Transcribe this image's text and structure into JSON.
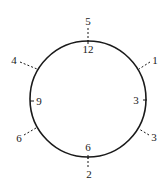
{
  "diagram": {
    "type": "clock-face-diagram",
    "circle": {
      "cx": 88,
      "cy": 99,
      "r": 58,
      "stroke": "#1a1a1a"
    },
    "inner_labels": [
      {
        "text": "12",
        "position": "top",
        "x": 88,
        "y": 49
      },
      {
        "text": "3",
        "position": "right",
        "x": 136,
        "y": 100
      },
      {
        "text": "6",
        "position": "bottom",
        "x": 88,
        "y": 147
      },
      {
        "text": "9",
        "position": "left",
        "x": 39,
        "y": 101
      }
    ],
    "outer_labels": [
      {
        "text": "5",
        "position": "top",
        "x": 88,
        "y": 21
      },
      {
        "text": "1",
        "position": "upper-right",
        "x": 155,
        "y": 60
      },
      {
        "text": "3",
        "position": "lower-right",
        "x": 154,
        "y": 137
      },
      {
        "text": "2",
        "position": "bottom",
        "x": 89,
        "y": 174
      },
      {
        "text": "6",
        "position": "lower-left",
        "x": 19,
        "y": 138
      },
      {
        "text": "4",
        "position": "upper-left",
        "x": 14,
        "y": 60
      }
    ],
    "leader_lines": [
      {
        "from": "top",
        "x1": 88,
        "y1": 28,
        "x2": 88,
        "y2": 44
      },
      {
        "from": "upper-right",
        "x1": 150,
        "y1": 62,
        "x2": 139,
        "y2": 69
      },
      {
        "from": "lower-right",
        "x1": 149,
        "y1": 135,
        "x2": 139,
        "y2": 129
      },
      {
        "from": "bottom",
        "x1": 88,
        "y1": 157,
        "x2": 88,
        "y2": 168
      },
      {
        "from": "lower-left",
        "x1": 24,
        "y1": 135,
        "x2": 36,
        "y2": 128
      },
      {
        "from": "upper-left",
        "x1": 20,
        "y1": 62,
        "x2": 37,
        "y2": 69
      }
    ],
    "tick_marks": [
      {
        "at": "top",
        "x1": 88,
        "y1": 40,
        "x2": 88,
        "y2": 44
      },
      {
        "at": "right",
        "x1": 143,
        "y1": 100,
        "x2": 147,
        "y2": 100
      },
      {
        "at": "bottom",
        "x1": 88,
        "y1": 155,
        "x2": 88,
        "y2": 159
      },
      {
        "at": "left",
        "x1": 30,
        "y1": 101,
        "x2": 34,
        "y2": 101
      }
    ]
  }
}
